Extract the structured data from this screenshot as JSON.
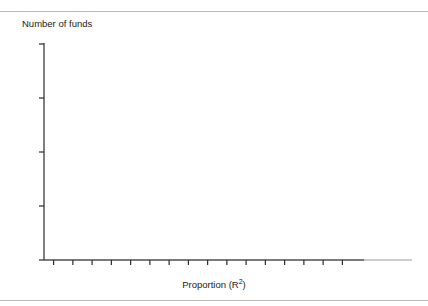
{
  "figure": {
    "cropped_header_text": "",
    "ylabel": "Number of funds",
    "xlabel_main": "Proportion (R",
    "xlabel_sup": "2",
    "xlabel_close": ")"
  },
  "colors": {
    "bar_outline": "#2b2b2b",
    "bar_fill": "#ffffff",
    "axis": "#2b2b2b",
    "text": "#1a1a1a",
    "rule": "#b9b9b9"
  },
  "chart_data": {
    "type": "bar",
    "title": "",
    "xlabel": "Proportion (R2)",
    "ylabel": "Number of funds",
    "xlim": [
      0.6375,
      1.0375
    ],
    "ylim": [
      0,
      40
    ],
    "bin_width": 0.0125,
    "grid": false,
    "legend": null,
    "yticks": [
      0,
      10,
      20,
      30,
      40
    ],
    "ytick_labels": [
      "0",
      "10",
      "20",
      "30",
      "40"
    ],
    "xticks": [
      0.65,
      0.7,
      0.75,
      0.8,
      0.85,
      0.9,
      0.95,
      1.0
    ],
    "xtick_labels": [
      ".65",
      ".70",
      ".75",
      ".80",
      ".85",
      ".90",
      ".95",
      "1.00"
    ],
    "bins": [
      {
        "x0": 0.6375,
        "x1": 0.6625,
        "value": 2
      },
      {
        "x0": 0.6625,
        "x1": 0.6875,
        "value": 1
      },
      {
        "x0": 0.6875,
        "x1": 0.7125,
        "value": 3
      },
      {
        "x0": 0.7125,
        "x1": 0.7375,
        "value": 1
      },
      {
        "x0": 0.7375,
        "x1": 0.7625,
        "value": 2
      },
      {
        "x0": 0.7625,
        "x1": 0.7875,
        "value": 5
      },
      {
        "x0": 0.7875,
        "x1": 0.8125,
        "value": 9
      },
      {
        "x0": 0.8125,
        "x1": 0.8375,
        "value": 10
      },
      {
        "x0": 0.8375,
        "x1": 0.8625,
        "value": 10
      },
      {
        "x0": 0.8625,
        "x1": 0.8875,
        "value": 13
      },
      {
        "x0": 0.8875,
        "x1": 0.9125,
        "value": 6
      },
      {
        "x0": 0.9125,
        "x1": 0.9375,
        "value": 17
      },
      {
        "x0": 0.9375,
        "x1": 0.9625,
        "value": 12
      },
      {
        "x0": 0.9625,
        "x1": 0.9875,
        "value": 11
      },
      {
        "x0": 0.9875,
        "x1": 1.0125,
        "value": 5
      }
    ],
    "categories": [
      ".65",
      ".67",
      ".70",
      ".72",
      ".75",
      ".77",
      ".80",
      ".82",
      ".85",
      ".87",
      ".90",
      ".92",
      ".95",
      ".97",
      "1.00"
    ],
    "values": [
      2,
      1,
      3,
      1,
      2,
      5,
      9,
      10,
      10,
      13,
      6,
      17,
      12,
      11,
      5
    ]
  }
}
